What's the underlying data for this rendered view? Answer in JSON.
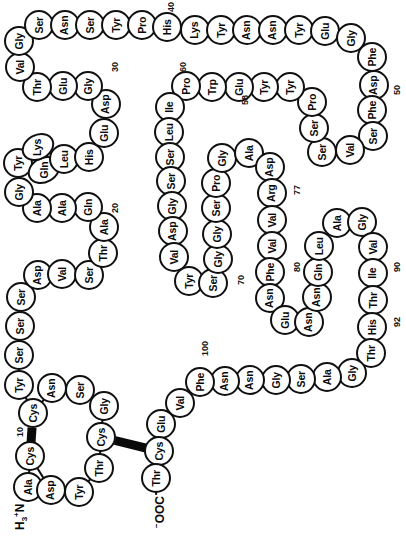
{
  "figure": {
    "orientation": "rotated-90",
    "residue_count": 104,
    "n_terminus_label": "H3N+",
    "c_terminus_label": "-OOC",
    "colors": {
      "stroke": "#101010",
      "fill": "#ffffff",
      "bond": "#0a0a0a"
    }
  },
  "sequence": [
    {
      "i": 1,
      "aa": "Ala",
      "x": 28,
      "y": 487
    },
    {
      "i": 2,
      "aa": "Cys",
      "x": 30,
      "y": 456
    },
    {
      "i": 3,
      "aa": "Asp",
      "x": 51,
      "y": 490
    },
    {
      "i": 4,
      "aa": "Tyr",
      "x": 79,
      "y": 492
    },
    {
      "i": 5,
      "aa": "Thr",
      "x": 99,
      "y": 468
    },
    {
      "i": 6,
      "aa": "Cys",
      "x": 101,
      "y": 437
    },
    {
      "i": 7,
      "aa": "Gly",
      "x": 104,
      "y": 406
    },
    {
      "i": 8,
      "aa": "Ser",
      "x": 80,
      "y": 390
    },
    {
      "i": 9,
      "aa": "Asn",
      "x": 52,
      "y": 388
    },
    {
      "i": 10,
      "aa": "Cys",
      "x": 33,
      "y": 413
    },
    {
      "i": 11,
      "aa": "Tyr",
      "x": 19,
      "y": 385
    },
    {
      "i": 12,
      "aa": "Ser",
      "x": 19,
      "y": 355
    },
    {
      "i": 13,
      "aa": "Ser",
      "x": 20,
      "y": 326
    },
    {
      "i": 14,
      "aa": "Ser",
      "x": 21,
      "y": 297
    },
    {
      "i": 15,
      "aa": "Asp",
      "x": 38,
      "y": 275
    },
    {
      "i": 16,
      "aa": "Val",
      "x": 62,
      "y": 274
    },
    {
      "i": 17,
      "aa": "Ser",
      "x": 89,
      "y": 275
    },
    {
      "i": 18,
      "aa": "Thr",
      "x": 103,
      "y": 253
    },
    {
      "i": 19,
      "aa": "Ala",
      "x": 104,
      "y": 227
    },
    {
      "i": 20,
      "aa": "Gln",
      "x": 88,
      "y": 207
    },
    {
      "i": 21,
      "aa": "Ala",
      "x": 62,
      "y": 208
    },
    {
      "i": 22,
      "aa": "Ala",
      "x": 37,
      "y": 208
    },
    {
      "i": 23,
      "aa": "Gly",
      "x": 19,
      "y": 192
    },
    {
      "i": 24,
      "aa": "Tyr",
      "x": 18,
      "y": 163
    },
    {
      "i": 25,
      "aa": "Gln",
      "x": 44,
      "y": 170,
      "shape": "slant"
    },
    {
      "i": 26,
      "aa": "Lys",
      "x": 38,
      "y": 147,
      "shape": "slant"
    },
    {
      "i": 27,
      "aa": "Leu",
      "x": 64,
      "y": 159
    },
    {
      "i": 28,
      "aa": "His",
      "x": 89,
      "y": 157
    },
    {
      "i": 29,
      "aa": "Glu",
      "x": 104,
      "y": 133
    },
    {
      "i": 30,
      "aa": "Asp",
      "x": 106,
      "y": 104
    },
    {
      "i": 31,
      "aa": "Gly",
      "x": 88,
      "y": 86
    },
    {
      "i": 32,
      "aa": "Glu",
      "x": 63,
      "y": 86
    },
    {
      "i": 33,
      "aa": "Thr",
      "x": 37,
      "y": 87
    },
    {
      "i": 34,
      "aa": "Val",
      "x": 20,
      "y": 67
    },
    {
      "i": 35,
      "aa": "Gly",
      "x": 19,
      "y": 41
    },
    {
      "i": 36,
      "aa": "Ser",
      "x": 39,
      "y": 25
    },
    {
      "i": 37,
      "aa": "Asn",
      "x": 65,
      "y": 25
    },
    {
      "i": 38,
      "aa": "Ser",
      "x": 90,
      "y": 25
    },
    {
      "i": 39,
      "aa": "Tyr",
      "x": 116,
      "y": 25
    },
    {
      "i": 40,
      "aa": "Pro",
      "x": 142,
      "y": 25
    },
    {
      "i": 41,
      "aa": "His",
      "x": 167,
      "y": 27
    },
    {
      "i": 42,
      "aa": "Lys",
      "x": 195,
      "y": 30
    },
    {
      "i": 43,
      "aa": "Tyr",
      "x": 221,
      "y": 30
    },
    {
      "i": 44,
      "aa": "Asn",
      "x": 247,
      "y": 30
    },
    {
      "i": 45,
      "aa": "Asn",
      "x": 273,
      "y": 30
    },
    {
      "i": 46,
      "aa": "Tyr",
      "x": 299,
      "y": 30
    },
    {
      "i": 47,
      "aa": "Glu",
      "x": 325,
      "y": 31
    },
    {
      "i": 48,
      "aa": "Gly",
      "x": 351,
      "y": 38
    },
    {
      "i": 49,
      "aa": "Phe",
      "x": 372,
      "y": 57
    },
    {
      "i": 50,
      "aa": "Asp",
      "x": 374,
      "y": 85
    },
    {
      "i": 51,
      "aa": "Phe",
      "x": 372,
      "y": 110
    },
    {
      "i": 52,
      "aa": "Ser",
      "x": 373,
      "y": 136
    },
    {
      "i": 53,
      "aa": "Val",
      "x": 350,
      "y": 150
    },
    {
      "i": 54,
      "aa": "Ser",
      "x": 322,
      "y": 152
    },
    {
      "i": 55,
      "aa": "Ser",
      "x": 314,
      "y": 128
    },
    {
      "i": 56,
      "aa": "Pro",
      "x": 312,
      "y": 102
    },
    {
      "i": 57,
      "aa": "Tyr",
      "x": 290,
      "y": 87
    },
    {
      "i": 58,
      "aa": "Tyr",
      "x": 264,
      "y": 87
    },
    {
      "i": 59,
      "aa": "Glu",
      "x": 239,
      "y": 87
    },
    {
      "i": 60,
      "aa": "Trp",
      "x": 212,
      "y": 87
    },
    {
      "i": 61,
      "aa": "Pro",
      "x": 186,
      "y": 86
    },
    {
      "i": 62,
      "aa": "Ile",
      "x": 170,
      "y": 107
    },
    {
      "i": 63,
      "aa": "Leu",
      "x": 169,
      "y": 132
    },
    {
      "i": 64,
      "aa": "Ser",
      "x": 170,
      "y": 157
    },
    {
      "i": 65,
      "aa": "Ser",
      "x": 171,
      "y": 181
    },
    {
      "i": 66,
      "aa": "Gly",
      "x": 172,
      "y": 206
    },
    {
      "i": 67,
      "aa": "Asp",
      "x": 173,
      "y": 231
    },
    {
      "i": 68,
      "aa": "Val",
      "x": 174,
      "y": 257
    },
    {
      "i": 69,
      "aa": "Tyr",
      "x": 189,
      "y": 281
    },
    {
      "i": 70,
      "aa": "Ser",
      "x": 213,
      "y": 283
    },
    {
      "i": 71,
      "aa": "Gly",
      "x": 218,
      "y": 259
    },
    {
      "i": 72,
      "aa": "Gly",
      "x": 217,
      "y": 234
    },
    {
      "i": 73,
      "aa": "Ser",
      "x": 216,
      "y": 208
    },
    {
      "i": 74,
      "aa": "Pro",
      "x": 216,
      "y": 183
    },
    {
      "i": 75,
      "aa": "Gly",
      "x": 222,
      "y": 158
    },
    {
      "i": 76,
      "aa": "Ala",
      "x": 249,
      "y": 153
    },
    {
      "i": 77,
      "aa": "Asp",
      "x": 270,
      "y": 167
    },
    {
      "i": 78,
      "aa": "Arg",
      "x": 272,
      "y": 193
    },
    {
      "i": 79,
      "aa": "Val",
      "x": 272,
      "y": 220
    },
    {
      "i": 80,
      "aa": "Val",
      "x": 272,
      "y": 246
    },
    {
      "i": 81,
      "aa": "Phe",
      "x": 270,
      "y": 272
    },
    {
      "i": 82,
      "aa": "Asn",
      "x": 270,
      "y": 298
    },
    {
      "i": 83,
      "aa": "Glu",
      "x": 285,
      "y": 320
    },
    {
      "i": 84,
      "aa": "Asn",
      "x": 309,
      "y": 322
    },
    {
      "i": 85,
      "aa": "Asn",
      "x": 317,
      "y": 297
    },
    {
      "i": 86,
      "aa": "Gln",
      "x": 318,
      "y": 272
    },
    {
      "i": 87,
      "aa": "Leu",
      "x": 319,
      "y": 246
    },
    {
      "i": 88,
      "aa": "Ala",
      "x": 337,
      "y": 223
    },
    {
      "i": 89,
      "aa": "Gly",
      "x": 362,
      "y": 222
    },
    {
      "i": 90,
      "aa": "Val",
      "x": 373,
      "y": 247
    },
    {
      "i": 91,
      "aa": "Ile",
      "x": 373,
      "y": 273
    },
    {
      "i": 92,
      "aa": "Thr",
      "x": 373,
      "y": 300
    },
    {
      "i": 93,
      "aa": "His",
      "x": 372,
      "y": 327
    },
    {
      "i": 94,
      "aa": "Thr",
      "x": 371,
      "y": 353
    },
    {
      "i": 95,
      "aa": "Gly",
      "x": 352,
      "y": 373
    },
    {
      "i": 96,
      "aa": "Ala",
      "x": 327,
      "y": 377
    },
    {
      "i": 97,
      "aa": "Ser",
      "x": 301,
      "y": 379
    },
    {
      "i": 98,
      "aa": "Gly",
      "x": 276,
      "y": 380
    },
    {
      "i": 99,
      "aa": "Asn",
      "x": 250,
      "y": 380
    },
    {
      "i": 100,
      "aa": "Asn",
      "x": 225,
      "y": 381
    },
    {
      "i": 101,
      "aa": "Phe",
      "x": 200,
      "y": 382
    },
    {
      "i": 102,
      "aa": "Val",
      "x": 180,
      "y": 403
    },
    {
      "i": 103,
      "aa": "Glu",
      "x": 161,
      "y": 424
    },
    {
      "i": 104,
      "aa": "Cys",
      "x": 159,
      "y": 451
    },
    {
      "i": 105,
      "aa": "Thr",
      "x": 156,
      "y": 478
    }
  ],
  "numbers": [
    {
      "label": "10",
      "x": 15,
      "y": 437
    },
    {
      "label": "20",
      "x": 110,
      "y": 213
    },
    {
      "label": "30",
      "x": 110,
      "y": 72
    },
    {
      "label": "40",
      "x": 166,
      "y": 12
    },
    {
      "label": "50",
      "x": 392,
      "y": 95
    },
    {
      "label": "58",
      "x": 240,
      "y": 105
    },
    {
      "label": "60",
      "x": 178,
      "y": 72
    },
    {
      "label": "70",
      "x": 236,
      "y": 285
    },
    {
      "label": "77",
      "x": 292,
      "y": 195
    },
    {
      "label": "80",
      "x": 292,
      "y": 272
    },
    {
      "label": "90",
      "x": 392,
      "y": 272
    },
    {
      "label": "92",
      "x": 392,
      "y": 327
    },
    {
      "label": "100",
      "x": 200,
      "y": 356
    }
  ],
  "termini": {
    "n_term": {
      "main": "H",
      "sub": "3",
      "rest": "N",
      "sup": "+",
      "x": 12,
      "y": 530
    },
    "c_term": {
      "sup": "−",
      "rest": "OOC",
      "x": 152,
      "y": 528
    }
  },
  "disulfides": [
    {
      "from": 2,
      "to": 10,
      "note": "Cys2-Cys10"
    },
    {
      "from": 6,
      "to": 104,
      "note": "Cys6-Cys104"
    }
  ]
}
